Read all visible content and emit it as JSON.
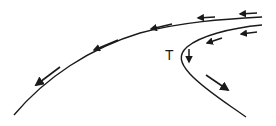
{
  "diagram": {
    "title": "",
    "stroke_color": "#1a1a1a",
    "background": "#ffffff",
    "labels": {
      "turning_point": "T"
    },
    "curves": [
      {
        "name": "outer-curve",
        "description": "Long curve from upper-right to lower-left"
      },
      {
        "name": "inner-curve",
        "description": "Curve from upper-right sweeping to turning point T then down-right"
      }
    ],
    "arrows": [
      {
        "name": "outer-arrow-lower-left",
        "direction": "down-left"
      },
      {
        "name": "outer-arrow-middle",
        "direction": "left"
      },
      {
        "name": "upper-arrow-1",
        "direction": "left"
      },
      {
        "name": "upper-arrow-2",
        "direction": "left"
      },
      {
        "name": "upper-arrow-3",
        "direction": "left"
      },
      {
        "name": "inner-arrow-1",
        "direction": "left"
      },
      {
        "name": "inner-arrow-2",
        "direction": "left"
      },
      {
        "name": "turning-point-arrow",
        "direction": "down"
      },
      {
        "name": "lower-branch-arrow",
        "direction": "down-right"
      }
    ]
  }
}
